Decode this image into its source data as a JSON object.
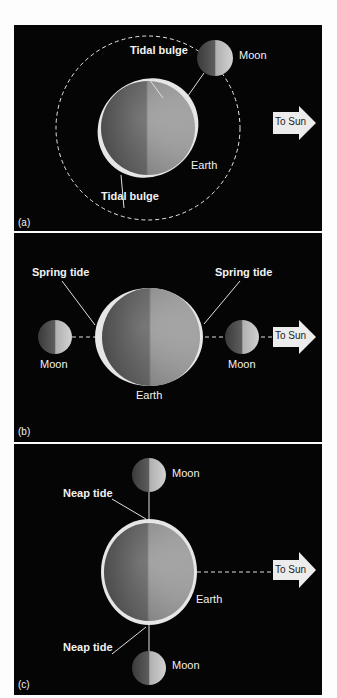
{
  "figure": {
    "colors": {
      "background": "#050505",
      "label_text": "#f2f2f2",
      "arrow_fill": "#ececec",
      "arrow_text": "#222222",
      "earth_dark": "#6e6e6e",
      "earth_light": "#c4c4c4",
      "bulge": "#e6e6e6"
    },
    "panels": [
      {
        "id": "a",
        "letter": "(a)",
        "labels": {
          "tidal_bulge_top": "Tidal bulge",
          "tidal_bulge_bottom": "Tidal bulge",
          "moon": "Moon",
          "earth": "Earth",
          "to_sun": "To Sun"
        }
      },
      {
        "id": "b",
        "letter": "(b)",
        "labels": {
          "spring_tide_left": "Spring tide",
          "spring_tide_right": "Spring tide",
          "moon_left": "Moon",
          "moon_right": "Moon",
          "earth": "Earth",
          "to_sun": "To Sun"
        }
      },
      {
        "id": "c",
        "letter": "(c)",
        "labels": {
          "neap_tide_top": "Neap tide",
          "neap_tide_bottom": "Neap tide",
          "moon_top": "Moon",
          "moon_bottom": "Moon",
          "earth": "Earth",
          "to_sun": "To Sun"
        }
      }
    ]
  }
}
